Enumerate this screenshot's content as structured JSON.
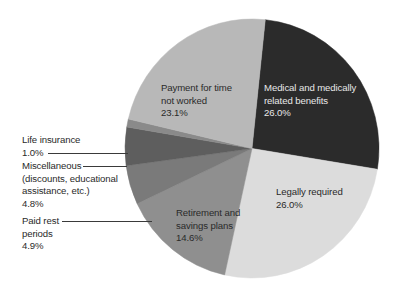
{
  "chart_data": {
    "type": "pie",
    "title": "",
    "start_angle_deg": 6,
    "direction": "clockwise",
    "slices": [
      {
        "name": "Medical and medically related benefits",
        "value": 26.0,
        "label_lines": [
          "Medical and medically",
          "related benefits"
        ],
        "pct_label": "26.0%",
        "color": "#2b2b2b"
      },
      {
        "name": "Legally required",
        "value": 26.0,
        "label_lines": [
          "Legally required"
        ],
        "pct_label": "26.0%",
        "color": "#dcdcdc"
      },
      {
        "name": "Retirement and savings plans",
        "value": 14.6,
        "label_lines": [
          "Retirement and",
          "savings plans"
        ],
        "pct_label": "14.6%",
        "color": "#8f8f8f"
      },
      {
        "name": "Paid rest periods",
        "value": 4.9,
        "label_lines": [
          "Paid rest",
          "periods"
        ],
        "pct_label": "4.9%",
        "color": "#7a7a7a"
      },
      {
        "name": "Miscellaneous (discounts, educational assistance, etc.)",
        "value": 4.8,
        "label_lines": [
          "Miscellaneous",
          "(discounts, educational",
          "assistance, etc.)"
        ],
        "pct_label": "4.8%",
        "color": "#5e5e5e"
      },
      {
        "name": "Life insurance",
        "value": 1.0,
        "label_lines": [
          "Life insurance"
        ],
        "pct_label": "1.0%",
        "color": "#8a8a8a"
      },
      {
        "name": "Payment for time not worked",
        "value": 23.1,
        "label_lines": [
          "Payment for time",
          "not worked"
        ],
        "pct_label": "23.1%",
        "color": "#b8b8b8"
      }
    ],
    "legend": "none (labels placed on/next to slices with leader lines for small slices)"
  },
  "labels": {
    "medical": {
      "l1": "Medical and medically",
      "l2": "related benefits",
      "pct": "26.0%"
    },
    "legal": {
      "l1": "Legally required",
      "pct": "26.0%"
    },
    "retirement": {
      "l1": "Retirement and",
      "l2": "savings plans",
      "pct": "14.6%"
    },
    "paid_rest": {
      "l1": "Paid rest",
      "l2": "periods",
      "pct": "4.9%"
    },
    "misc": {
      "l1": "Miscellaneous",
      "l2": "(discounts, educational",
      "l3": "assistance, etc.)",
      "pct": "4.8%"
    },
    "life": {
      "l1": "Life insurance",
      "pct": "1.0%"
    },
    "payment": {
      "l1": "Payment for time",
      "l2": "not worked",
      "pct": "23.1%"
    }
  }
}
